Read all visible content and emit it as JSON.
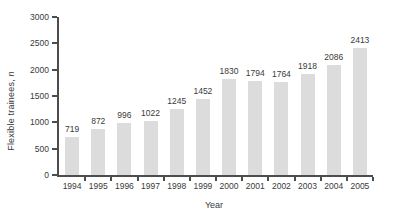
{
  "figure": {
    "background": "#ffffff"
  },
  "chart_data": {
    "type": "bar",
    "categories": [
      "1994",
      "1995",
      "1996",
      "1997",
      "1998",
      "1999",
      "2000",
      "2001",
      "2002",
      "2003",
      "2004",
      "2005"
    ],
    "values": [
      719,
      872,
      996,
      1022,
      1245,
      1452,
      1830,
      1794,
      1764,
      1918,
      2086,
      2413
    ],
    "title": "",
    "xlabel": "Year",
    "ylabel_prefix": "Flexible trainees, ",
    "ylabel_italic": "n",
    "ylim": [
      0,
      3000
    ],
    "yticks": [
      0,
      500,
      1000,
      1500,
      2000,
      2500,
      3000
    ],
    "grid": false,
    "legend": "none",
    "value_labels": true,
    "bar_color": "#dcdcdc",
    "axis_color": "#4d4d4d",
    "text_color": "#3a3a3a"
  }
}
